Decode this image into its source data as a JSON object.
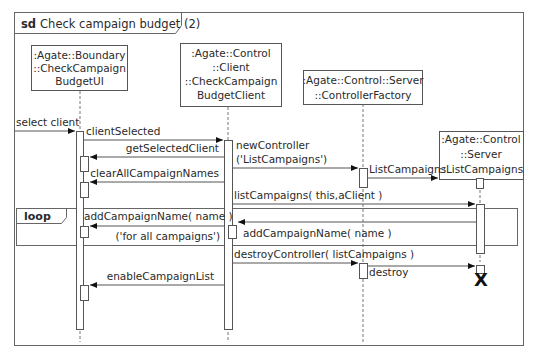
{
  "diagram": {
    "type": "sequence",
    "frame_label_kw": "sd",
    "frame_title": "Check campaign budget (2)",
    "lifelines": [
      {
        "id": "ui",
        "lines": [
          ":Agate::Boundary",
          "::CheckCampaign",
          "BudgetUI"
        ]
      },
      {
        "id": "client",
        "lines": [
          ":Agate::Control",
          "::Client",
          "::CheckCampaign",
          "BudgetClient"
        ]
      },
      {
        "id": "factory",
        "lines": [
          ":Agate::Control::Server",
          "::ControllerFactory"
        ]
      },
      {
        "id": "server",
        "lines": [
          ":Agate::Control",
          "::Server",
          "::ListCampaigns"
        ]
      }
    ],
    "messages": [
      {
        "from": "actor",
        "to": "ui",
        "label": "select client"
      },
      {
        "from": "ui",
        "to": "client",
        "label": "clientSelected"
      },
      {
        "from": "client",
        "to": "ui",
        "label": "getSelectedClient"
      },
      {
        "from": "client",
        "to": "factory",
        "label_line1": "newController",
        "label_line2": "('ListCampaigns')"
      },
      {
        "from": "factory",
        "to": "server",
        "label": "ListCampaigns"
      },
      {
        "from": "client",
        "to": "ui",
        "label": "clearAllCampaignNames"
      },
      {
        "from": "client",
        "to": "server",
        "label": "listCampaigns( this,aClient )"
      },
      {
        "from": "client",
        "to": "ui",
        "label": "addCampaignName( name )"
      },
      {
        "from": "server",
        "to": "client",
        "label": "addCampaignName( name )"
      },
      {
        "from": "client",
        "to": "factory",
        "label": "destroyController( listCampaigns )"
      },
      {
        "from": "factory",
        "to": "server",
        "label": "destroy"
      },
      {
        "from": "client",
        "to": "ui",
        "label": "enableCampaignList"
      }
    ],
    "loop": {
      "operator": "loop",
      "guard": "('for all campaigns')"
    },
    "destroy_mark": "X"
  }
}
